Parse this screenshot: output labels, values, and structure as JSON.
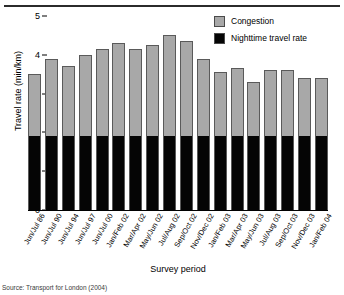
{
  "chart_data": {
    "type": "bar",
    "stacked": true,
    "title": "",
    "xlabel": "Survey period",
    "ylabel": "Travel rate (min/km)",
    "ylim": [
      0,
      5
    ],
    "yticks": [
      0,
      1,
      2,
      3,
      4,
      5
    ],
    "grid": false,
    "legend_position": "top-right",
    "categories": [
      "Jun/Jul 86",
      "Jun/Jul 90",
      "Jun/Jul 94",
      "Jun/Jul 97",
      "Jun/Jul 00",
      "Jan/Feb 02",
      "Mar/Apr 02",
      "May/Jun 02",
      "Jul/Aug 02",
      "Sep/Oct 02",
      "Nov/Dec 02",
      "Jan/Feb 03",
      "Mar/Apr 03",
      "May/Jun 03",
      "Jul/Aug 03",
      "Sep/Oct 03",
      "Nov/Dec 03",
      "Jan/Feb 04"
    ],
    "series": [
      {
        "name": "Nighttime travel rate",
        "color": "#050505",
        "values": [
          1.9,
          1.9,
          1.9,
          1.9,
          1.9,
          1.9,
          1.9,
          1.9,
          1.9,
          1.9,
          1.9,
          1.9,
          1.9,
          1.9,
          1.9,
          1.9,
          1.9,
          1.9
        ]
      },
      {
        "name": "Congestion",
        "color": "#a8a8a8",
        "values": [
          1.6,
          2.0,
          1.8,
          2.1,
          2.25,
          2.4,
          2.25,
          2.35,
          2.6,
          2.45,
          2.0,
          1.65,
          1.75,
          1.4,
          1.7,
          1.7,
          1.5,
          1.5
        ]
      }
    ],
    "totals": [
      3.5,
      3.9,
      3.7,
      4.0,
      4.15,
      4.3,
      4.15,
      4.25,
      4.5,
      4.35,
      3.9,
      3.55,
      3.65,
      3.3,
      3.6,
      3.6,
      3.4,
      3.4
    ]
  },
  "legend": {
    "items": [
      {
        "label": "Congestion",
        "color": "#a8a8a8"
      },
      {
        "label": "Nighttime travel rate",
        "color": "#050505"
      }
    ]
  },
  "axes": {
    "y_title": "Travel rate (min/km)",
    "x_title": "Survey period",
    "y_tick_labels": [
      "5",
      "4",
      "3",
      "2",
      "1",
      "0"
    ]
  },
  "source_note": "Source: Transport for London (2004)"
}
